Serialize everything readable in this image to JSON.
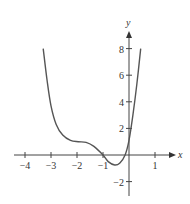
{
  "chart_data": {
    "type": "line",
    "title": "",
    "xlabel": "x",
    "ylabel": "y",
    "xlim": [
      -4.5,
      1.7
    ],
    "ylim": [
      -3,
      9
    ],
    "grid": false,
    "x_ticks": [
      -4,
      -3,
      -2,
      -1,
      1
    ],
    "x_tick_labels": [
      "−4",
      "−3",
      "−2",
      "−1",
      "1"
    ],
    "y_ticks": [
      8,
      6,
      4,
      2,
      -2
    ],
    "y_tick_labels": [
      "8",
      "6",
      "4",
      "2",
      "−2"
    ],
    "series": [
      {
        "name": "f(x)",
        "x": [
          -3.3,
          -3.15,
          -3.0,
          -2.8,
          -2.55,
          -2.25,
          -1.95,
          -1.65,
          -1.35,
          -1.0,
          -0.8,
          -0.55,
          -0.35,
          -0.15,
          0.0,
          0.15,
          0.3,
          0.45
        ],
        "y": [
          8.0,
          5.6,
          3.7,
          2.3,
          1.5,
          1.1,
          1.0,
          0.95,
          0.65,
          0.0,
          -0.5,
          -0.75,
          -0.6,
          0.0,
          1.1,
          3.0,
          5.3,
          8.0
        ]
      }
    ],
    "color": "#555555"
  }
}
